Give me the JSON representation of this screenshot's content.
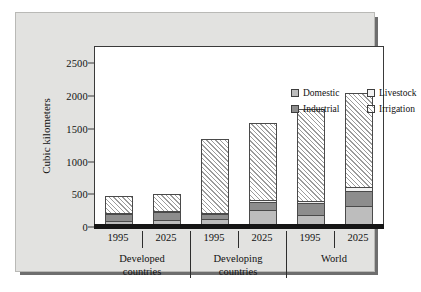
{
  "chart_data": {
    "type": "bar",
    "title": "",
    "subtitle": "",
    "xlabel": "",
    "ylabel": "Cubic kilometers",
    "ylim": [
      0,
      2750
    ],
    "yticks": [
      0,
      500,
      1000,
      1500,
      2000,
      2500
    ],
    "ytick_labels": [
      "0",
      "500",
      "1000",
      "1500",
      "2000",
      "2500"
    ],
    "grid": false,
    "stacked": true,
    "legend_position": "top-center-inside",
    "groups": [
      {
        "name": "Developed countries",
        "line1": "Developed",
        "line2": "countries"
      },
      {
        "name": "Developing countries",
        "line1": "Developing",
        "line2": "countries"
      },
      {
        "name": "World",
        "line1": "World",
        "line2": ""
      }
    ],
    "categories": [
      "Developed countries 1995",
      "Developed countries 2025",
      "Developing countries 1995",
      "Developing countries 2025",
      "World 1995",
      "World 2025"
    ],
    "year_labels": [
      "1995",
      "2025",
      "1995",
      "2025",
      "1995",
      "2025"
    ],
    "series": [
      {
        "name": "Domestic",
        "color": "#bdbdbd",
        "pattern": "solid-light",
        "values": [
          70,
          80,
          100,
          230,
          160,
          300
        ]
      },
      {
        "name": "Industrial",
        "color": "#8d8d8d",
        "pattern": "solid-dark",
        "values": [
          105,
          125,
          65,
          125,
          175,
          235
        ]
      },
      {
        "name": "Livestock",
        "color": "#f2f2f2",
        "pattern": "dotted",
        "values": [
          20,
          20,
          30,
          35,
          40,
          55
        ]
      },
      {
        "name": "Irrigation",
        "color": "#e9e9e9",
        "pattern": "diagonal-hatch",
        "values": [
          285,
          275,
          1155,
          1200,
          1425,
          1460
        ]
      }
    ],
    "totals": [
      480,
      500,
      1350,
      1590,
      1800,
      2050
    ]
  },
  "legend": {
    "items": [
      {
        "label": "Domestic",
        "swatch": "domestic-swatch"
      },
      {
        "label": "Livestock",
        "swatch": "livestock-swatch"
      },
      {
        "label": "Industrial",
        "swatch": "industrial-swatch"
      },
      {
        "label": "Irrigation",
        "swatch": "irrigation-swatch"
      }
    ]
  }
}
